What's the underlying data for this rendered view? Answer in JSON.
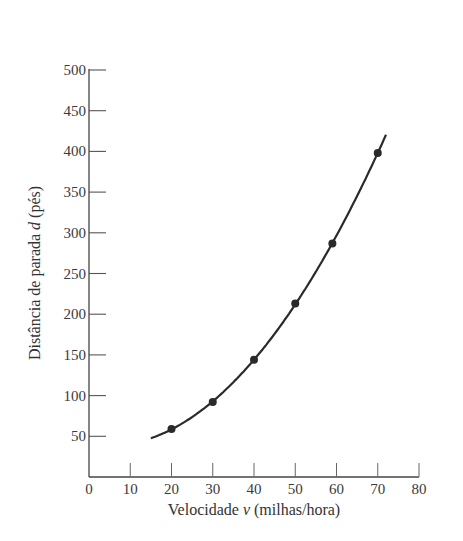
{
  "chart_data": {
    "type": "scatter",
    "title": "",
    "xlabel": "Velocidade v (milhas/hora)",
    "xlabel_parts": {
      "prefix": "Velocidade ",
      "var": "v",
      "suffix": " (milhas/hora)"
    },
    "ylabel": "Distância de parada d (pés)",
    "ylabel_parts": {
      "prefix": "Distância de parada ",
      "var": "d",
      "suffix": " (pés)"
    },
    "xlim": [
      0,
      80
    ],
    "ylim": [
      0,
      500
    ],
    "x_ticks": [
      0,
      10,
      20,
      30,
      40,
      50,
      60,
      70,
      80
    ],
    "y_ticks": [
      50,
      100,
      150,
      200,
      250,
      300,
      350,
      400,
      450,
      500
    ],
    "grid": false,
    "legend": null,
    "series": [
      {
        "name": "observed",
        "kind": "points",
        "x": [
          20,
          30,
          40,
          50,
          59,
          70
        ],
        "y": [
          59,
          92,
          144,
          213,
          287,
          398
        ]
      },
      {
        "name": "fitted curve",
        "kind": "smooth line",
        "x_range": [
          15,
          72
        ],
        "note": "smooth increasing quadratic-like curve through the points"
      }
    ],
    "colors": {
      "ink": "#333333",
      "background": "#ffffff"
    }
  }
}
